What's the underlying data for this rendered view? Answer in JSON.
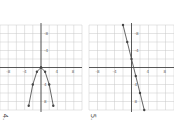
{
  "chart_data": [
    {
      "type": "line",
      "exercise_label": "4.",
      "orientation": "rotated 90 degrees clockwise",
      "xlabel": "x",
      "ylabel": "y",
      "x_ticks": [
        -8,
        -4,
        4,
        8
      ],
      "y_ticks": [
        -8,
        -4,
        4,
        8
      ],
      "xlim": [
        -10,
        10
      ],
      "ylim": [
        -10,
        10
      ],
      "grid": true,
      "series": [
        {
          "name": "upper branch",
          "points": [
            [
              0,
              0
            ],
            [
              1,
              1
            ],
            [
              4,
              2
            ],
            [
              9,
              3
            ]
          ]
        },
        {
          "name": "lower branch",
          "points": [
            [
              0,
              0
            ],
            [
              1,
              -1
            ],
            [
              4,
              -2
            ],
            [
              9,
              -3
            ]
          ]
        }
      ]
    },
    {
      "type": "line",
      "exercise_label": "5.",
      "orientation": "rotated 90 degrees clockwise",
      "xlabel": "x",
      "ylabel": "y",
      "x_ticks": [
        -8,
        -4,
        4,
        8
      ],
      "y_ticks": [
        -8,
        -4,
        4,
        8
      ],
      "xlim": [
        -10,
        10
      ],
      "ylim": [
        -10,
        10
      ],
      "grid": true,
      "series": [
        {
          "name": "line",
          "points": [
            [
              -10,
              -2
            ],
            [
              -6,
              -1
            ],
            [
              -2,
              0
            ],
            [
              2,
              1
            ],
            [
              6,
              2
            ],
            [
              10,
              3
            ]
          ]
        }
      ]
    }
  ],
  "labels": {
    "ex4": "4.",
    "ex5": "5.",
    "x_axis": "x",
    "y_axis": "y"
  },
  "colors": {
    "grid": "#c8c8c8",
    "axis": "#333333",
    "curve": "#555555",
    "point": "#444444"
  }
}
